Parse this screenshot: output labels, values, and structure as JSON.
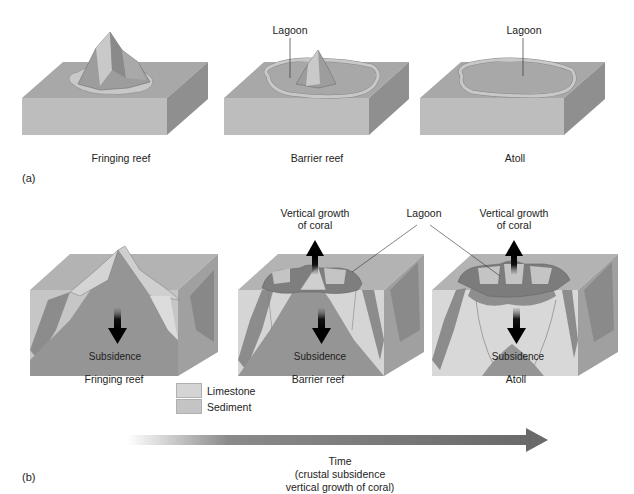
{
  "panel_a": {
    "tag": "(a)",
    "stages": [
      {
        "label": "Fringing reef"
      },
      {
        "label": "Barrier reef",
        "callout": "Lagoon"
      },
      {
        "label": "Atoll",
        "callout": "Lagoon"
      }
    ]
  },
  "panel_b": {
    "tag": "(b)",
    "stages": [
      {
        "label": "Fringing reef",
        "arrow_down": "Subsidence"
      },
      {
        "label": "Barrier reef",
        "arrow_down": "Subsidence",
        "arrow_up": "Vertical growth\nof coral"
      },
      {
        "label": "Atoll",
        "arrow_down": "Subsidence",
        "arrow_up": "Vertical growth\nof coral"
      }
    ],
    "lagoon_callout": "Lagoon",
    "vertical_growth_line1": "Vertical growth",
    "vertical_growth_line2": "of coral",
    "subsidence": "Subsidence"
  },
  "legend": {
    "items": [
      {
        "label": "Limestone",
        "color": "#d4d4d4"
      },
      {
        "label": "Sediment",
        "color": "#c4c4c4"
      }
    ]
  },
  "time_axis": {
    "line1": "Time",
    "line2": "(crustal subsidence",
    "line3": "vertical growth of coral)"
  },
  "colors": {
    "block_top": "#a9a9a9",
    "block_front": "#b9b9b9",
    "block_side": "#8e8e8e",
    "mountain": "#9a9a9a",
    "reef": "#c8c8c8",
    "arrow": "#111111"
  }
}
